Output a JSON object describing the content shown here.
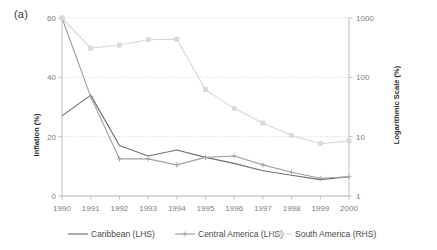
{
  "panel": {
    "label": "(a)"
  },
  "chart_data": {
    "type": "line",
    "title": "",
    "xlabel": "",
    "ylabel": "Inflation (%)",
    "y2label": "Logarithmic Scale (%)",
    "grid": true,
    "legend_position": "bottom",
    "x": [
      1990,
      1991,
      1992,
      1993,
      1994,
      1995,
      1996,
      1997,
      1998,
      1999,
      2000
    ],
    "xtick_labels": [
      "1990",
      "1991",
      "1992",
      "1993",
      "1994",
      "1995",
      "1996",
      "1997",
      "1998",
      "1999",
      "2000"
    ],
    "ylim": [
      0,
      60
    ],
    "ytick_labels": [
      "0",
      "20",
      "40",
      "60"
    ],
    "ytick_values": [
      0,
      20,
      40,
      60
    ],
    "y2lim": [
      1,
      1000
    ],
    "y2scale": "log",
    "y2tick_labels": [
      "1",
      "10",
      "100",
      "1000"
    ],
    "y2tick_values": [
      1,
      10,
      100,
      1000
    ],
    "series": [
      {
        "name": "Caribbean (LHS)",
        "axis": "left",
        "color": "#6f6f6f",
        "marker": "none",
        "values": [
          27.0,
          34.0,
          17.0,
          13.5,
          15.5,
          13.0,
          11.0,
          8.5,
          7.0,
          5.5,
          6.5
        ]
      },
      {
        "name": "Central America (LHS)",
        "axis": "left",
        "color": "#a0a0a0",
        "marker": "plus",
        "values": [
          60.0,
          33.5,
          12.5,
          12.5,
          10.5,
          13.0,
          13.5,
          10.5,
          8.0,
          6.0,
          6.5
        ]
      },
      {
        "name": "South America (RHS)",
        "axis": "right",
        "color": "#d9d9d9",
        "marker": "square",
        "values": [
          1000,
          310,
          350,
          430,
          440,
          62,
          30,
          17,
          10.5,
          7.6,
          8.5
        ]
      }
    ],
    "legend": [
      {
        "label": "Caribbean (LHS)",
        "color": "#6f6f6f",
        "marker": "none"
      },
      {
        "label": "Central America (LHS)",
        "color": "#a0a0a0",
        "marker": "plus"
      },
      {
        "label": "South America (RHS)",
        "color": "#d9d9d9",
        "marker": "square"
      }
    ]
  }
}
